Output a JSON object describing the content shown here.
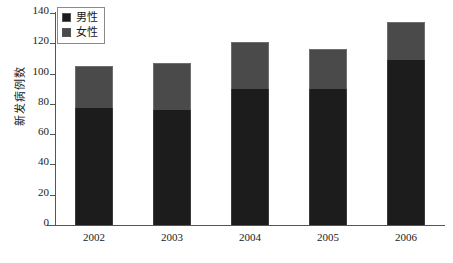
{
  "chart_data": {
    "type": "bar",
    "stacked": true,
    "title": "",
    "xlabel": "年",
    "ylabel": "新发病例数",
    "categories": [
      "2002",
      "2003",
      "2004",
      "2005",
      "2006"
    ],
    "ylim": [
      0,
      140
    ],
    "ytick_step": 20,
    "yticks": [
      "0",
      "20",
      "40",
      "60",
      "80",
      "100",
      "120",
      "140"
    ],
    "grid": false,
    "legend_position": "top-left",
    "series": [
      {
        "name": "男性",
        "color": "#1c1c1c",
        "values": [
          77,
          76,
          90,
          90,
          109
        ]
      },
      {
        "name": "女性",
        "color": "#4a4a4a",
        "values": [
          28,
          31,
          31,
          26,
          25
        ]
      }
    ],
    "totals": [
      105,
      107,
      121,
      116,
      134
    ]
  },
  "axis": {
    "y_title": "新发病例数",
    "x_unit": "(年)"
  },
  "legend": {
    "items": [
      {
        "label": "男性",
        "swatch": "male-swatch"
      },
      {
        "label": "女性",
        "swatch": "female-swatch"
      }
    ]
  }
}
